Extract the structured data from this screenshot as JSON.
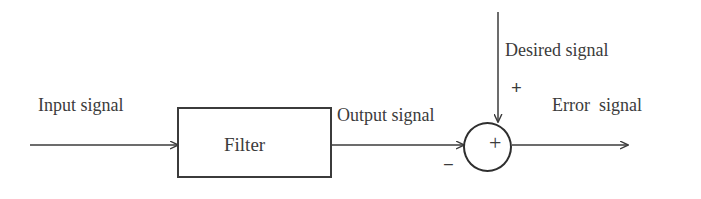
{
  "diagram": {
    "title_text": "",
    "background_color": "#ffffff",
    "stroke_color": "#3b3b3b",
    "blocks": [
      {
        "id": "filter",
        "label": "Filter",
        "shape": "rectangle"
      },
      {
        "id": "summer",
        "label": "+",
        "shape": "circle"
      }
    ],
    "labels": {
      "input_signal": "Input signal",
      "output_signal": "Output signal",
      "desired_signal": "Desired signal",
      "error_signal": "Error  signal",
      "filter": "Filter",
      "summing_plus": "+",
      "desired_input_sign": "+",
      "output_input_sign": "−"
    },
    "arrows": [
      {
        "id": "input-arrow",
        "from": "input-signal-source",
        "to": "filter",
        "direction": "right"
      },
      {
        "id": "filter-to-summer-arrow",
        "from": "filter",
        "to": "summer",
        "direction": "right"
      },
      {
        "id": "desired-arrow",
        "from": "desired-signal-source",
        "to": "summer",
        "direction": "down"
      },
      {
        "id": "error-arrow",
        "from": "summer",
        "to": "error-signal-output",
        "direction": "right"
      }
    ]
  }
}
